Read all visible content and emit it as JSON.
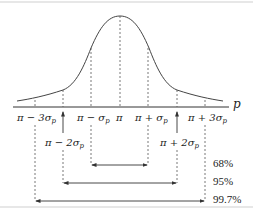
{
  "diagram": {
    "axis_label": "p",
    "colors": {
      "line": "#333333",
      "dashed": "#555555",
      "border": "#cfcfcf"
    },
    "tick_labels": {
      "m3": "π − 3σ",
      "m2": "π − 2σ",
      "m1": "π − σ",
      "mu": "π",
      "p1": "π + σ",
      "p2": "π + 2σ",
      "p3": "π + 3σ",
      "sub": "p"
    },
    "intervals": [
      {
        "label": "68%",
        "range": "π ± σp"
      },
      {
        "label": "95%",
        "range": "π ± 2σp"
      },
      {
        "label": "99.7%",
        "range": "π ± 3σp"
      }
    ]
  }
}
